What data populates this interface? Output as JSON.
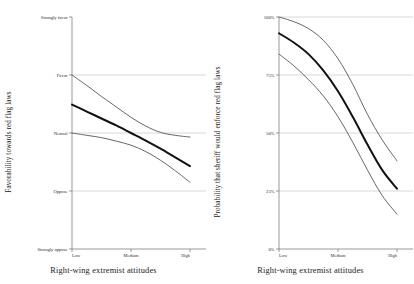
{
  "figure": {
    "background": "#ffffff",
    "line_color": "#111111",
    "ci_color": "#4a4a4a",
    "grid_color": "#b9b9c4",
    "axis_color": "#6f6f6f"
  },
  "panels": {
    "left": {
      "ylabel": "Favorability towards red flag laws",
      "xlabel": "Right-wing extremist attitudes",
      "ytick_labels": [
        "Strongly favor",
        "Favor",
        "Neutral",
        "Oppose",
        "Strongly oppose"
      ],
      "xtick_labels": [
        "Low",
        "Medium",
        "High"
      ]
    },
    "right": {
      "ylabel": "Probability that sheriff would enforce red flag laws",
      "xlabel": "Right-wing extremist attitudes",
      "ytick_labels": [
        "100%",
        "75%",
        "50%",
        "25%",
        "0%"
      ],
      "xtick_labels": [
        "Low",
        "Medium",
        "High"
      ]
    }
  },
  "chart_data": [
    {
      "type": "line",
      "panel": "left",
      "title": "",
      "xlabel": "Right-wing extremist attitudes",
      "ylabel": "Favorability towards red flag laws",
      "x": [
        0,
        0.125,
        0.25,
        0.375,
        0.5,
        0.625,
        0.75,
        0.875,
        1
      ],
      "xtick_values": [
        0,
        0.5,
        1
      ],
      "xtick_labels": [
        "Low",
        "Medium",
        "High"
      ],
      "ytick_values": [
        5,
        4,
        3,
        2,
        1
      ],
      "ytick_labels": [
        "Strongly favor",
        "Favor",
        "Neutral",
        "Oppose",
        "Strongly oppose"
      ],
      "ylim": [
        1,
        5
      ],
      "grid": "horizontal",
      "legend": "none",
      "series": [
        {
          "name": "Upper 95% CI",
          "style": "thin",
          "values": [
            4.0,
            3.82,
            3.63,
            3.45,
            3.27,
            3.12,
            3.01,
            2.96,
            2.93
          ]
        },
        {
          "name": "Predicted favorability",
          "style": "thick",
          "values": [
            3.49,
            3.37,
            3.25,
            3.13,
            3.0,
            2.87,
            2.73,
            2.58,
            2.43
          ]
        },
        {
          "name": "Lower 95% CI",
          "style": "thin",
          "values": [
            3.0,
            2.96,
            2.92,
            2.86,
            2.79,
            2.68,
            2.53,
            2.35,
            2.15
          ]
        }
      ]
    },
    {
      "type": "line",
      "panel": "right",
      "title": "",
      "xlabel": "Right-wing extremist attitudes",
      "ylabel": "Probability that sheriff would enforce red flag laws",
      "x": [
        0,
        0.125,
        0.25,
        0.375,
        0.5,
        0.625,
        0.75,
        0.875,
        1
      ],
      "xtick_values": [
        0,
        0.5,
        1
      ],
      "xtick_labels": [
        "Low",
        "Medium",
        "High"
      ],
      "ytick_values": [
        100,
        75,
        50,
        25,
        0
      ],
      "ytick_labels": [
        "100%",
        "75%",
        "50%",
        "25%",
        "0%"
      ],
      "ylim": [
        0,
        100
      ],
      "units": "percent",
      "grid": "horizontal",
      "legend": "none",
      "series": [
        {
          "name": "Upper 95% CI",
          "style": "thin",
          "values": [
            100,
            98,
            95,
            90,
            82,
            71,
            58,
            47,
            38
          ]
        },
        {
          "name": "Predicted probability",
          "style": "thick",
          "values": [
            93,
            89,
            84,
            77,
            68,
            57,
            45,
            34,
            26
          ]
        },
        {
          "name": "Lower 95% CI",
          "style": "thin",
          "values": [
            84,
            79,
            73,
            66,
            57,
            46,
            34,
            23,
            15
          ]
        }
      ]
    }
  ]
}
